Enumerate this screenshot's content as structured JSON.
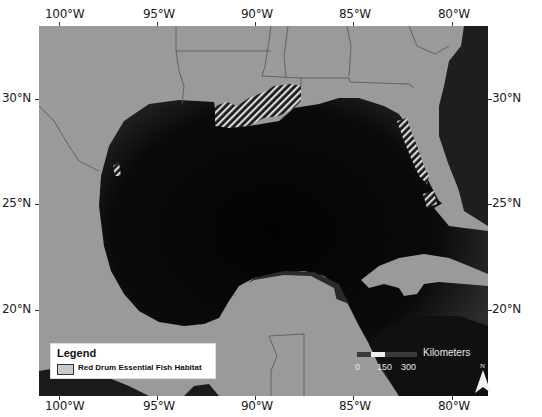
{
  "map": {
    "colors": {
      "land": "#9a9a9a",
      "ocean_shelf": "#2a2a2a",
      "ocean_deep": "#050505",
      "boundary": "#555555",
      "habitat_stripe": "#d8d8d8"
    },
    "top_axis": {
      "labels": [
        "100°W",
        "95°W",
        "90°W",
        "85°W",
        "80°W"
      ]
    },
    "bottom_axis": {
      "labels": [
        "100°W",
        "95°W",
        "90°W",
        "85°W",
        "80°W"
      ]
    },
    "left_axis": {
      "labels": [
        "30°N",
        "25°N",
        "20°N"
      ]
    },
    "right_axis": {
      "labels": [
        "30°N",
        "25°N",
        "20°N"
      ]
    },
    "legend": {
      "title": "Legend",
      "items": [
        {
          "label": "Red Drum Essential Fish Habitat",
          "swatch": "hatched"
        }
      ]
    },
    "scale_bar": {
      "unit": "Kilometers",
      "ticks": [
        "0",
        "150",
        "300"
      ]
    },
    "north_arrow": {
      "label": "N"
    }
  }
}
